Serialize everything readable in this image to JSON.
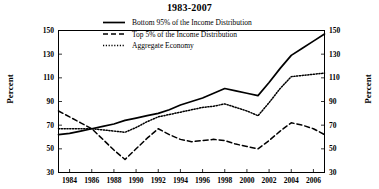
{
  "chart_data": {
    "type": "line",
    "title": "1983-2007",
    "xlabel": "",
    "ylabel": "Percent",
    "ylabel_right": "Percent",
    "xlim": [
      1983,
      2007
    ],
    "ylim": [
      30,
      150
    ],
    "yticks": [
      30,
      50,
      70,
      90,
      110,
      130,
      150
    ],
    "xticks": [
      1984,
      1986,
      1988,
      1990,
      1992,
      1994,
      1996,
      1998,
      2000,
      2002,
      2004,
      2006
    ],
    "grid": false,
    "legend_position": "top-center",
    "x": [
      1983,
      1984,
      1985,
      1986,
      1987,
      1988,
      1989,
      1990,
      1991,
      1992,
      1993,
      1994,
      1995,
      1996,
      1997,
      1998,
      1999,
      2000,
      2001,
      2002,
      2003,
      2004,
      2005,
      2006,
      2007
    ],
    "series": [
      {
        "name": "Bottom 95% of the Income Distribution",
        "style": "solid",
        "color": "#000000",
        "values": [
          62,
          63,
          65,
          67,
          69,
          71,
          74,
          76,
          78,
          80,
          83,
          87,
          90,
          93,
          97,
          101,
          99,
          97,
          95,
          106,
          118,
          129,
          135,
          141,
          147
        ]
      },
      {
        "name": "Top 5% of the Income Distribution",
        "style": "dashed",
        "color": "#000000",
        "values": [
          82,
          77,
          72,
          67,
          58,
          49,
          41,
          50,
          59,
          67,
          62,
          58,
          56,
          57,
          58,
          57,
          54,
          52,
          50,
          57,
          65,
          72,
          70,
          67,
          62
        ]
      },
      {
        "name": "Aggregate Economy",
        "style": "dotted",
        "color": "#000000",
        "values": [
          67,
          67,
          67,
          67,
          66,
          65,
          64,
          68,
          73,
          77,
          79,
          81,
          83,
          85,
          86,
          88,
          85,
          82,
          78,
          89,
          101,
          111,
          112,
          113,
          114
        ]
      }
    ]
  },
  "legend": {
    "items": [
      {
        "label": "Bottom 95% of the Income Distribution",
        "style": "solid"
      },
      {
        "label": "Top 5% of the Income Distribution",
        "style": "dashed"
      },
      {
        "label": "Aggregate Economy",
        "style": "dotted"
      }
    ]
  },
  "axes": {
    "left_title": "Percent",
    "right_title": "Percent",
    "y_tick_labels": [
      "150",
      "130",
      "110",
      "90",
      "70",
      "50",
      "30"
    ],
    "x_tick_labels": [
      "1984",
      "1986",
      "1988",
      "1990",
      "1992",
      "1994",
      "1996",
      "1998",
      "2000",
      "2002",
      "2004",
      "2006"
    ]
  }
}
